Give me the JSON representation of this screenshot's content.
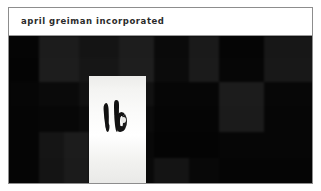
{
  "document": {
    "title": "april greiman incorporated",
    "frame_border_color": "#8d8d8d",
    "page_background": "#ffffff"
  },
  "titlebar": {
    "text": "april greiman incorporated",
    "background": "#ffffff",
    "text_color": "#2b2b2b",
    "rule_color": "#9a9a9a"
  },
  "artwork": {
    "name": "dark checkerboard field with white panel",
    "background": "#070707",
    "panel": {
      "name": "white vertical panel",
      "fill": "#ffffff",
      "x": 80,
      "y": 40,
      "w": 57,
      "h": 108
    },
    "glyphs": {
      "name": "abstract dark figure marks",
      "fill": "#111111",
      "count": 2
    },
    "checker_tiles": [
      {
        "x": 0,
        "y": 0,
        "w": 30,
        "h": 22,
        "color": "#050505"
      },
      {
        "x": 30,
        "y": 0,
        "w": 40,
        "h": 22,
        "color": "#1c1c1c"
      },
      {
        "x": 70,
        "y": 0,
        "w": 40,
        "h": 22,
        "color": "#141414"
      },
      {
        "x": 110,
        "y": 0,
        "w": 35,
        "h": 22,
        "color": "#1d1d1d"
      },
      {
        "x": 145,
        "y": 0,
        "w": 35,
        "h": 22,
        "color": "#0a0a0a"
      },
      {
        "x": 180,
        "y": 0,
        "w": 30,
        "h": 22,
        "color": "#1a1a1a"
      },
      {
        "x": 210,
        "y": 0,
        "w": 45,
        "h": 22,
        "color": "#050505"
      },
      {
        "x": 255,
        "y": 0,
        "w": 50,
        "h": 22,
        "color": "#171717"
      },
      {
        "x": 0,
        "y": 22,
        "w": 30,
        "h": 24,
        "color": "#040404"
      },
      {
        "x": 30,
        "y": 22,
        "w": 40,
        "h": 24,
        "color": "#1d1d1d"
      },
      {
        "x": 70,
        "y": 22,
        "w": 40,
        "h": 24,
        "color": "#161616"
      },
      {
        "x": 110,
        "y": 22,
        "w": 35,
        "h": 24,
        "color": "#1e1e1e"
      },
      {
        "x": 145,
        "y": 22,
        "w": 35,
        "h": 24,
        "color": "#0b0b0b"
      },
      {
        "x": 180,
        "y": 22,
        "w": 30,
        "h": 24,
        "color": "#1b1b1b"
      },
      {
        "x": 210,
        "y": 22,
        "w": 45,
        "h": 24,
        "color": "#060606"
      },
      {
        "x": 255,
        "y": 22,
        "w": 50,
        "h": 24,
        "color": "#181818"
      },
      {
        "x": 0,
        "y": 46,
        "w": 30,
        "h": 24,
        "color": "#060606"
      },
      {
        "x": 30,
        "y": 46,
        "w": 40,
        "h": 24,
        "color": "#0a0a0a"
      },
      {
        "x": 70,
        "y": 46,
        "w": 75,
        "h": 24,
        "color": "#111111"
      },
      {
        "x": 145,
        "y": 46,
        "w": 65,
        "h": 24,
        "color": "#060606"
      },
      {
        "x": 210,
        "y": 46,
        "w": 45,
        "h": 24,
        "color": "#1c1c1c"
      },
      {
        "x": 255,
        "y": 46,
        "w": 50,
        "h": 24,
        "color": "#070707"
      },
      {
        "x": 0,
        "y": 70,
        "w": 30,
        "h": 26,
        "color": "#050505"
      },
      {
        "x": 30,
        "y": 70,
        "w": 40,
        "h": 26,
        "color": "#070707"
      },
      {
        "x": 70,
        "y": 70,
        "w": 75,
        "h": 26,
        "color": "#0b0b0b"
      },
      {
        "x": 145,
        "y": 70,
        "w": 65,
        "h": 26,
        "color": "#050505"
      },
      {
        "x": 210,
        "y": 70,
        "w": 45,
        "h": 26,
        "color": "#1b1b1b"
      },
      {
        "x": 255,
        "y": 70,
        "w": 50,
        "h": 26,
        "color": "#060606"
      },
      {
        "x": 0,
        "y": 96,
        "w": 30,
        "h": 26,
        "color": "#050505"
      },
      {
        "x": 30,
        "y": 96,
        "w": 25,
        "h": 26,
        "color": "#151515"
      },
      {
        "x": 55,
        "y": 96,
        "w": 25,
        "h": 26,
        "color": "#1c1c1c"
      },
      {
        "x": 80,
        "y": 96,
        "w": 65,
        "h": 26,
        "color": "#080808"
      },
      {
        "x": 145,
        "y": 96,
        "w": 65,
        "h": 26,
        "color": "#040404"
      },
      {
        "x": 210,
        "y": 96,
        "w": 95,
        "h": 26,
        "color": "#060606"
      },
      {
        "x": 0,
        "y": 122,
        "w": 30,
        "h": 26,
        "color": "#050505"
      },
      {
        "x": 30,
        "y": 122,
        "w": 25,
        "h": 26,
        "color": "#141414"
      },
      {
        "x": 55,
        "y": 122,
        "w": 25,
        "h": 26,
        "color": "#1b1b1b"
      },
      {
        "x": 80,
        "y": 122,
        "w": 65,
        "h": 26,
        "color": "#090909"
      },
      {
        "x": 145,
        "y": 122,
        "w": 35,
        "h": 26,
        "color": "#141414"
      },
      {
        "x": 180,
        "y": 122,
        "w": 30,
        "h": 26,
        "color": "#080808"
      },
      {
        "x": 210,
        "y": 122,
        "w": 95,
        "h": 26,
        "color": "#050505"
      }
    ]
  }
}
